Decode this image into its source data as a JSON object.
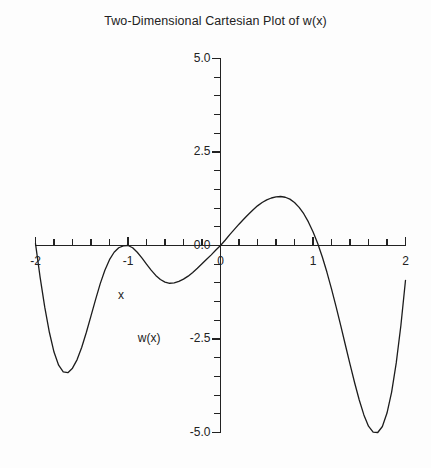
{
  "chart_data": {
    "type": "line",
    "title": "Two-Dimensional Cartesian Plot of w(x)",
    "xlabel": "x",
    "ylabel": "w(x)",
    "xlim": [
      -2,
      2
    ],
    "ylim": [
      -5.0,
      5.0
    ],
    "grid": false,
    "legend": null,
    "x_tick_labels": [
      "-2",
      "-1",
      "0",
      "1",
      "2"
    ],
    "x_tick_values": [
      -2,
      -1,
      0,
      1,
      2
    ],
    "x_minor_tick_step": 0.2,
    "y_tick_labels": [
      "5.0",
      "2.5",
      "0.0",
      "-2.5",
      "-5.0"
    ],
    "y_tick_values": [
      5.0,
      2.5,
      0.0,
      -2.5,
      -5.0
    ],
    "y_minor_tick_step": 0.5,
    "series": [
      {
        "name": "w(x)",
        "color": "#1c1c1c",
        "x": [
          -2.0,
          -1.95,
          -1.9,
          -1.85,
          -1.8,
          -1.75,
          -1.7,
          -1.65,
          -1.6,
          -1.55,
          -1.5,
          -1.45,
          -1.4,
          -1.35,
          -1.3,
          -1.25,
          -1.2,
          -1.15,
          -1.1,
          -1.05,
          -1.0,
          -0.95,
          -0.9,
          -0.85,
          -0.8,
          -0.75,
          -0.7,
          -0.65,
          -0.6,
          -0.55,
          -0.5,
          -0.45,
          -0.4,
          -0.35,
          -0.3,
          -0.25,
          -0.2,
          -0.15,
          -0.1,
          -0.05,
          0.0,
          0.05,
          0.1,
          0.15,
          0.2,
          0.25,
          0.3,
          0.35,
          0.4,
          0.45,
          0.5,
          0.55,
          0.6,
          0.65,
          0.7,
          0.75,
          0.8,
          0.85,
          0.9,
          0.95,
          1.0,
          1.05,
          1.1,
          1.15,
          1.2,
          1.25,
          1.3,
          1.35,
          1.4,
          1.45,
          1.5,
          1.55,
          1.6,
          1.65,
          1.7,
          1.75,
          1.8,
          1.85,
          1.9,
          1.95,
          2.0
        ],
        "y": [
          0.05,
          -0.85,
          -1.65,
          -2.32,
          -2.85,
          -3.2,
          -3.38,
          -3.4,
          -3.28,
          -3.05,
          -2.72,
          -2.32,
          -1.88,
          -1.44,
          -1.02,
          -0.66,
          -0.38,
          -0.18,
          -0.06,
          -0.01,
          0.0,
          -0.06,
          -0.18,
          -0.33,
          -0.5,
          -0.66,
          -0.8,
          -0.91,
          -0.98,
          -1.01,
          -1.0,
          -0.96,
          -0.9,
          -0.82,
          -0.72,
          -0.61,
          -0.49,
          -0.37,
          -0.25,
          -0.12,
          0.0,
          0.14,
          0.29,
          0.43,
          0.57,
          0.7,
          0.83,
          0.95,
          1.06,
          1.15,
          1.22,
          1.27,
          1.3,
          1.31,
          1.29,
          1.24,
          1.15,
          1.02,
          0.85,
          0.63,
          0.37,
          0.06,
          -0.3,
          -0.71,
          -1.16,
          -1.64,
          -2.14,
          -2.66,
          -3.17,
          -3.67,
          -4.13,
          -4.53,
          -4.83,
          -4.99,
          -5.0,
          -4.84,
          -4.48,
          -3.92,
          -3.14,
          -2.14,
          -0.93
        ],
        "annotations": {
          "zeros": [
            -2.0,
            -1.0,
            0.0,
            1.07
          ],
          "local_minima": [
            {
              "x": -1.66,
              "y": -3.4
            },
            {
              "x": -0.55,
              "y": -1.01
            },
            {
              "x": 1.7,
              "y": -5.0
            }
          ],
          "local_maxima": [
            {
              "x": 0.65,
              "y": 1.31
            }
          ]
        }
      }
    ]
  }
}
